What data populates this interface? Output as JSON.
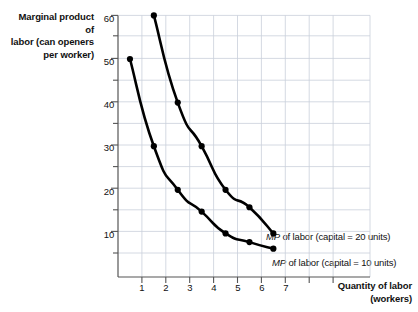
{
  "chart_data": {
    "type": "line",
    "title": "",
    "subtitle": "",
    "xlabel": "Quantity of labor",
    "xlabel_line2": "(workers)",
    "ylabel": "Marginal product of",
    "ylabel_line2": "labor (can openers",
    "ylabel_line3": "per worker)",
    "xlim": [
      0,
      9.4
    ],
    "ylim": [
      0,
      62
    ],
    "xticks": [
      1,
      2,
      3,
      4,
      5,
      6,
      7
    ],
    "xticks_unlabeled": [
      8,
      9
    ],
    "yticks": [
      10,
      20,
      30,
      40,
      50,
      60
    ],
    "yticks_minor": [
      15,
      25,
      35,
      45,
      55
    ],
    "grid": true,
    "legend_position": "inline-right",
    "series": [
      {
        "name": "MP of labor (capital = 20 units)",
        "name_italic_prefix": "MP",
        "name_rest": " of labor (capital = 20 units)",
        "color": "#000000",
        "x": [
          1.5,
          2.5,
          3.5,
          4.5,
          5.5,
          6.5
        ],
        "values": [
          60,
          40,
          30,
          20,
          16,
          10
        ]
      },
      {
        "name": "MP of labor (capital = 10 units)",
        "name_italic_prefix": "MP",
        "name_rest": " of labor (capital = 10 units)",
        "color": "#000000",
        "x": [
          0.5,
          1.5,
          2.5,
          3.5,
          4.5,
          5.5,
          6.5
        ],
        "values": [
          50,
          30,
          20,
          15,
          10,
          8,
          6.5
        ]
      }
    ],
    "colors": {
      "curve": "#000000",
      "grid": "#c9cfdb",
      "axis": "#555555",
      "text": "#111111"
    }
  },
  "axis": {
    "ytick_labels": [
      "60",
      "50",
      "40",
      "30",
      "20",
      "10"
    ],
    "xtick_labels": [
      "1",
      "2",
      "3",
      "4",
      "5",
      "6",
      "7"
    ]
  },
  "labels": {
    "curve_upper_italic": "MP",
    "curve_upper_rest": " of labor (capital = 20 units)",
    "curve_lower_italic": "MP",
    "curve_lower_rest": " of labor (capital = 10 units)"
  }
}
